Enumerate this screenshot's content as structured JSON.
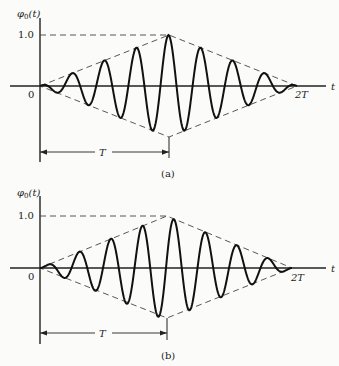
{
  "chart_data": [
    {
      "type": "line",
      "panel_label": "(a)",
      "ylabel": "φ0(t)",
      "xlabel": "t",
      "y_tick": "1.0",
      "origin_label": "0",
      "x_end_label": "2T",
      "span_label": "T",
      "description": "Triangular-envelope cosine pulse, peak amplitude 1.0 at t = T, ~8 cycles over [0, 2T]",
      "envelope": {
        "x": [
          0,
          1,
          2
        ],
        "upper": [
          0,
          1.0,
          0
        ],
        "lower": [
          0,
          -1.0,
          0
        ],
        "x_units": "T"
      },
      "carrier": "cos",
      "cycles": 8,
      "ylim": [
        -1.1,
        1.2
      ],
      "xlim": [
        0,
        2
      ]
    },
    {
      "type": "line",
      "panel_label": "(b)",
      "ylabel": "φ0(t)",
      "xlabel": "t",
      "y_tick": "1.0",
      "origin_label": "0",
      "x_end_label": "2T",
      "span_label": "T",
      "description": "Triangular-envelope sine pulse, zero crossing at t = T, ~8 cycles over [0, 2T]",
      "envelope": {
        "x": [
          0,
          1,
          2
        ],
        "upper": [
          0,
          1.0,
          0
        ],
        "lower": [
          0,
          -1.0,
          0
        ],
        "x_units": "T"
      },
      "carrier": "sin",
      "cycles": 8,
      "ylim": [
        -1.1,
        1.2
      ],
      "xlim": [
        0,
        2
      ]
    }
  ],
  "panels": {
    "a": {
      "ylabel": "φ",
      "ysub": "0",
      "yarg": "(t)",
      "tick": "1.0",
      "zero": "0",
      "end": "2T",
      "t": "t",
      "span": "T",
      "caption": "(a)"
    },
    "b": {
      "ylabel": "φ",
      "ysub": "0",
      "yarg": "(t)",
      "tick": "1.0",
      "zero": "0",
      "end": "2T",
      "t": "t",
      "span": "T",
      "caption": "(b)"
    }
  }
}
